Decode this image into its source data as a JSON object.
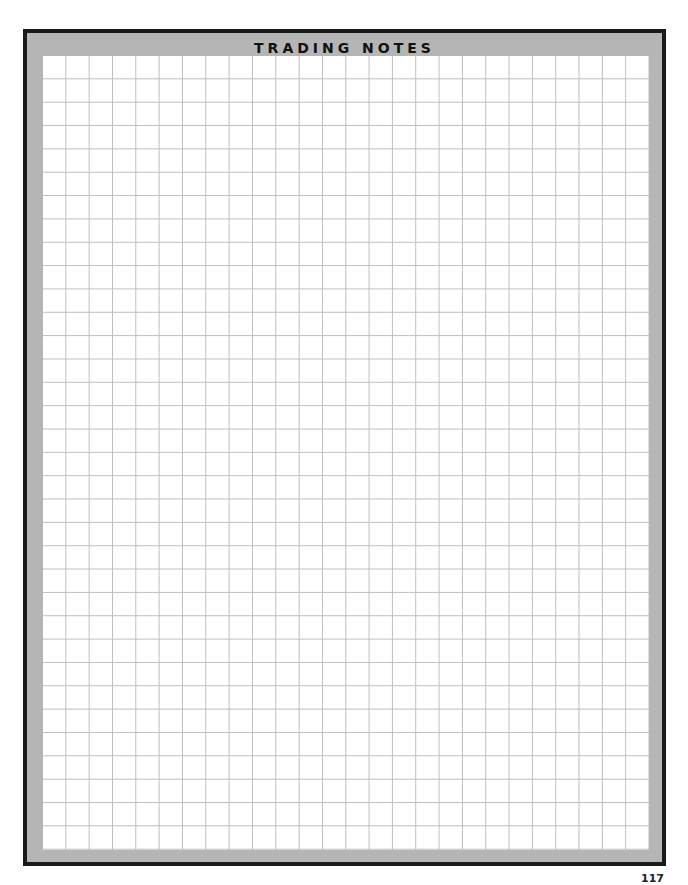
{
  "page": {
    "title": "TRADING NOTES",
    "page_number": "117",
    "colors": {
      "border": "#1a1a1a",
      "frame": "#b5b5b5",
      "grid_line": "#bdbdbd",
      "paper": "#ffffff"
    },
    "grid": {
      "columns": 26,
      "rows": 34
    }
  }
}
